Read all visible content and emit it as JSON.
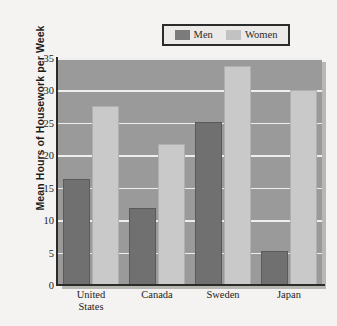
{
  "chart_data": {
    "type": "bar",
    "title": "",
    "subtitle": "",
    "xlabel": "",
    "ylabel": "Mean Hours of Housework per Week",
    "categories": [
      "United States",
      "Canada",
      "Sweden",
      "Japan"
    ],
    "category_lines": [
      [
        "United",
        "States"
      ],
      [
        "Canada",
        ""
      ],
      [
        "Sweden",
        ""
      ],
      [
        "Japan",
        ""
      ]
    ],
    "series": [
      {
        "name": "Men",
        "color": "#707070",
        "values": [
          16.0,
          11.6,
          24.8,
          5.0
        ]
      },
      {
        "name": "Women",
        "color": "#c9c9c9",
        "values": [
          27.3,
          21.4,
          33.5,
          29.8
        ]
      }
    ],
    "ylim": [
      0,
      35
    ],
    "yticks": [
      0,
      5,
      10,
      15,
      20,
      25,
      30,
      35
    ],
    "ytick_labels": [
      "0",
      "5",
      "10",
      "15",
      "20",
      "25",
      "30",
      "35"
    ],
    "grid": true,
    "grid_orientation": "horizontal",
    "grid_color": "#eeeeee",
    "legend_position": "top",
    "plot_background": "#9a9a9a",
    "page_background": "#f4f3f1",
    "axis_color": "#2b2b2b"
  },
  "legend": {
    "entries": [
      {
        "label": "Men",
        "swatch": "men"
      },
      {
        "label": "Women",
        "swatch": "women"
      }
    ]
  }
}
